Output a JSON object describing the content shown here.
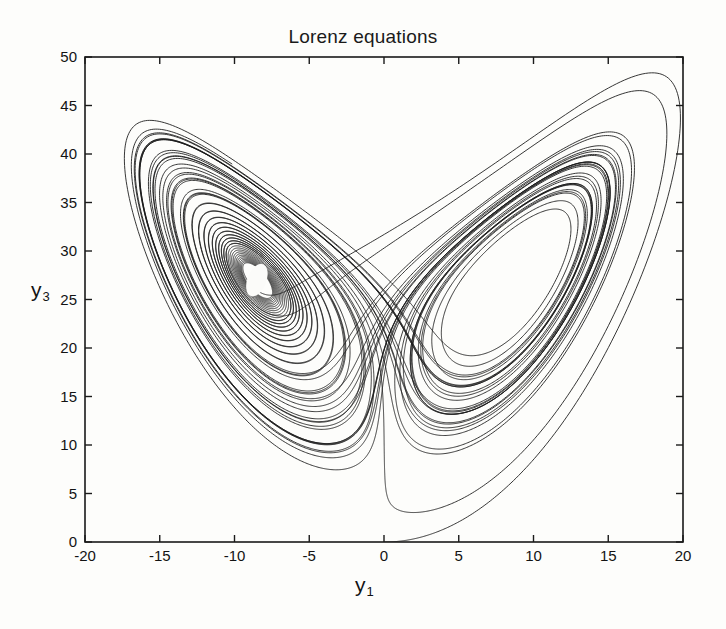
{
  "figure": {
    "title": "Lorenz equations",
    "background_color": "#fdfdfb",
    "line_color": "#1a1a1a",
    "axis_color": "#1a1a1a"
  },
  "axes": {
    "xlabel": "y",
    "xlabel_sub": "1",
    "ylabel": "y",
    "ylabel_sub": "3",
    "xticks": [
      "-20",
      "-15",
      "-10",
      "-5",
      "0",
      "5",
      "10",
      "15",
      "20"
    ],
    "xtick_values": [
      -20,
      -15,
      -10,
      -5,
      0,
      5,
      10,
      15,
      20
    ],
    "yticks": [
      "0",
      "5",
      "10",
      "15",
      "20",
      "25",
      "30",
      "35",
      "40",
      "45",
      "50"
    ],
    "ytick_values": [
      0,
      5,
      10,
      15,
      20,
      25,
      30,
      35,
      40,
      45,
      50
    ],
    "xlim": [
      -20,
      20
    ],
    "ylim": [
      0,
      50
    ],
    "grid": false,
    "box": true,
    "tick_direction": "in"
  },
  "chart_data": {
    "type": "line",
    "title": "Lorenz equations",
    "xlabel": "y_1",
    "ylabel": "y_3",
    "xlim": [
      -20,
      20
    ],
    "ylim": [
      0,
      50
    ],
    "grid": false,
    "legend": null,
    "system": {
      "equations": [
        "dy1/dt = sigma*(y2 - y1)",
        "dy2/dt = y1*(rho - y3) - y2",
        "dy3/dt = y1*y2 - beta*y3"
      ],
      "sigma": 10,
      "rho": 28,
      "beta": 2.6666666667
    },
    "initial_conditions": {
      "y1": 0.0,
      "y2": 1.0,
      "y3": 0.0
    },
    "integration": {
      "dt": 0.0018,
      "steps": 33000,
      "method": "rk4"
    },
    "series": [
      {
        "name": "trajectory",
        "x_range": [
          -19.0,
          19.6
        ],
        "y_range": [
          0.0,
          49.2
        ],
        "fixed_points": [
          {
            "name": "C+",
            "x": 8.485,
            "y": 27.0
          },
          {
            "name": "C-",
            "x": -8.485,
            "y": 27.0
          }
        ],
        "features": [
          {
            "name": "left-lobe-dense-core",
            "x": -8.5,
            "y": 27.0,
            "note": "densely overdrawn spiral core with small white elliptical eye"
          },
          {
            "name": "right-lobe-open-core",
            "x": 8.8,
            "y": 26.5,
            "note": "open white interior"
          },
          {
            "name": "left-lobe-top",
            "x": -16.0,
            "y": 44.0
          },
          {
            "name": "right-lobe-top",
            "x": 17.8,
            "y": 49.0
          },
          {
            "name": "left-lobe-bottom",
            "x": -3.2,
            "y": 7.0
          },
          {
            "name": "right-lobe-bottom",
            "x": 3.0,
            "y": 6.9
          },
          {
            "name": "crossing-saddle",
            "x": 0.0,
            "y": 21.5
          },
          {
            "name": "initial-transient",
            "x": 0.5,
            "y": 0.3,
            "note": "outer sweep from origin to lower right"
          }
        ]
      }
    ]
  }
}
